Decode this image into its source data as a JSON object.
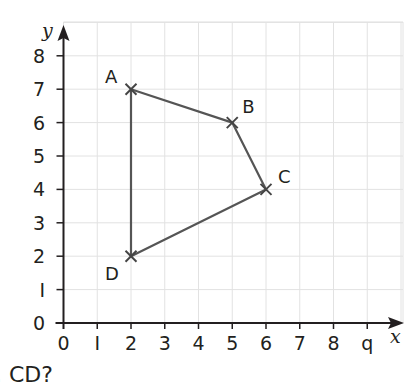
{
  "chart_data": {
    "type": "scatter",
    "title": "",
    "xlabel": "x",
    "ylabel": "y",
    "xlim": [
      0,
      9
    ],
    "ylim": [
      0,
      8
    ],
    "grid": true,
    "x_ticks": [
      "0",
      "1",
      "2",
      "3",
      "4",
      "5",
      "6",
      "7",
      "8",
      "9"
    ],
    "y_ticks": [
      "0",
      "1",
      "2",
      "3",
      "4",
      "5",
      "6",
      "7",
      "8"
    ],
    "points": [
      {
        "label": "A",
        "x": 2,
        "y": 7
      },
      {
        "label": "B",
        "x": 5,
        "y": 6
      },
      {
        "label": "C",
        "x": 6,
        "y": 4
      },
      {
        "label": "D",
        "x": 2,
        "y": 2
      }
    ],
    "polygon": [
      "A",
      "B",
      "C",
      "D"
    ],
    "marker": "x",
    "colors": {
      "line": "#555555",
      "axis": "#231f20",
      "grid": "#e2e2e2"
    }
  },
  "question_text": "CD?"
}
